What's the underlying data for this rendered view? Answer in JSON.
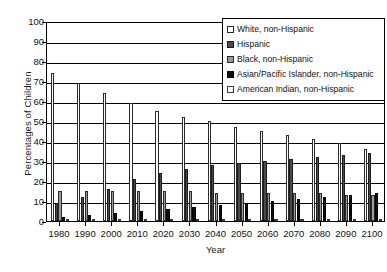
{
  "chart_data": {
    "type": "bar",
    "title": "",
    "xlabel": "Year",
    "ylabel": "Percentages of Children",
    "ylim": [
      0,
      100
    ],
    "ytick_step": 10,
    "grid": true,
    "legend_position": "top-right",
    "categories": [
      "1980",
      "1990",
      "2000",
      "2010",
      "2020",
      "2030",
      "2040",
      "2050",
      "2060",
      "2070",
      "2080",
      "2090",
      "2100"
    ],
    "yticks": [
      "0",
      "10",
      "20",
      "30",
      "40",
      "50",
      "60",
      "70",
      "80",
      "90",
      "100"
    ],
    "series": [
      {
        "name": "White, non-Hispanic",
        "swatch": "#ffffff",
        "values": [
          74,
          69,
          64,
          59,
          55,
          52,
          50,
          47,
          45,
          43,
          41,
          39,
          36
        ]
      },
      {
        "name": "Hispanic",
        "swatch": "#4a4a4a",
        "values": [
          9,
          12,
          16,
          21,
          24,
          26,
          28,
          29,
          30,
          31,
          32,
          33,
          34
        ]
      },
      {
        "name": "Black, non-Hispanic",
        "swatch": "#9a9a9a",
        "values": [
          15,
          15,
          15,
          15,
          15,
          15,
          14,
          14,
          14,
          14,
          14,
          13,
          13
        ]
      },
      {
        "name": "Asian/Pacific Islander, non-Hispanic",
        "swatch": "#0d0d0d",
        "values": [
          2,
          3,
          4,
          5,
          6,
          7,
          8,
          9,
          10,
          11,
          12,
          13,
          14
        ]
      },
      {
        "name": "American Indian, non-Hispanic",
        "swatch": "#fbfbfb",
        "values": [
          1,
          1,
          1,
          1,
          1,
          1,
          1,
          1,
          1,
          1,
          1,
          1,
          1
        ]
      }
    ]
  }
}
